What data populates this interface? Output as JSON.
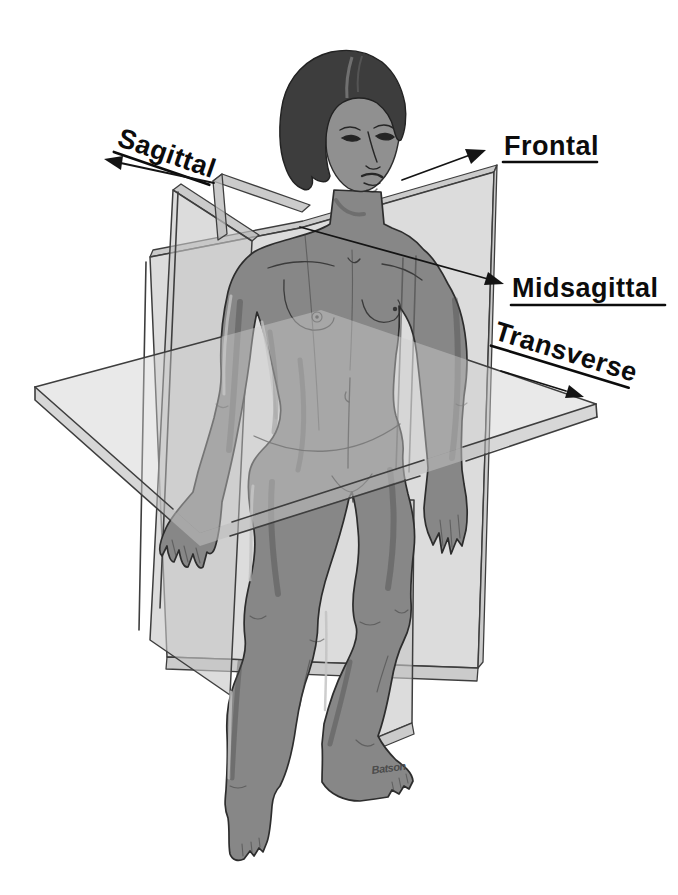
{
  "illustration": {
    "description": "Anatomical planes of the human body – standing female figure intersected by four labeled body planes",
    "labels": {
      "sagittal": "Sagittal",
      "frontal": "Frontal",
      "midsagittal": "Midsagittal",
      "transverse": "Transverse"
    },
    "signature": "Batson",
    "colors": {
      "background": "#ffffff",
      "plane_fill": "#c7c7c7",
      "plane_edge": "#3e3e3e",
      "body_fill": "#878787",
      "body_outline": "#2d2d2d",
      "hair": "#3d3d3d",
      "label_text": "#0c0c0c"
    }
  }
}
